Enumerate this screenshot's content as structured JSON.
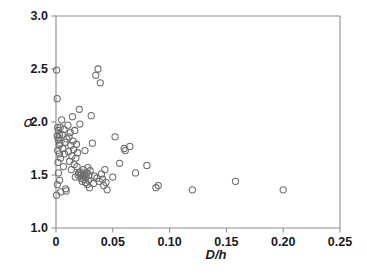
{
  "chart_data": {
    "type": "scatter",
    "title": "",
    "xlabel": "D/h",
    "ylabel": "σ",
    "xlim": [
      0,
      0.25
    ],
    "ylim": [
      1.0,
      3.0
    ],
    "xticks": [
      0,
      0.05,
      0.1,
      0.15,
      0.2,
      0.25
    ],
    "xtick_labels": [
      "0",
      "0.05",
      "0.10",
      "0.15",
      "0.20",
      "0.25"
    ],
    "yticks": [
      1.0,
      1.5,
      2.0,
      2.5,
      3.0
    ],
    "ytick_labels": [
      "1.0",
      "1.5",
      "2.0",
      "2.5",
      "3.0"
    ],
    "grid": false,
    "legend": null,
    "marker": "open-circle",
    "marker_size": 4.2,
    "marker_color": "#6b6b6b",
    "axis_color": "#8c8c8c",
    "background": "#ffffff",
    "n_points": 96,
    "series": [
      {
        "name": "samples",
        "x": [
          0.0005,
          0.0005,
          0.001,
          0.001,
          0.0012,
          0.0015,
          0.0015,
          0.0018,
          0.002,
          0.002,
          0.0022,
          0.0025,
          0.0028,
          0.003,
          0.003,
          0.0032,
          0.0035,
          0.0038,
          0.004,
          0.0042,
          0.005,
          0.0055,
          0.006,
          0.0065,
          0.007,
          0.0075,
          0.008,
          0.0085,
          0.009,
          0.0095,
          0.0105,
          0.011,
          0.0115,
          0.012,
          0.0125,
          0.013,
          0.0135,
          0.014,
          0.0145,
          0.015,
          0.0155,
          0.016,
          0.0165,
          0.017,
          0.0175,
          0.018,
          0.0185,
          0.019,
          0.0195,
          0.02,
          0.0205,
          0.021,
          0.0215,
          0.022,
          0.0225,
          0.023,
          0.0235,
          0.024,
          0.0245,
          0.025,
          0.0255,
          0.026,
          0.0265,
          0.027,
          0.0275,
          0.028,
          0.0285,
          0.029,
          0.0295,
          0.03,
          0.031,
          0.032,
          0.033,
          0.034,
          0.035,
          0.036,
          0.037,
          0.038,
          0.039,
          0.04,
          0.041,
          0.042,
          0.043,
          0.044,
          0.045,
          0.05,
          0.052,
          0.056,
          0.06,
          0.061,
          0.065,
          0.07,
          0.08,
          0.088,
          0.09,
          0.12,
          0.158,
          0.2
        ],
        "y": [
          2.49,
          1.31,
          2.22,
          1.87,
          1.41,
          1.95,
          1.73,
          1.62,
          1.92,
          1.83,
          1.52,
          1.85,
          1.78,
          1.88,
          1.7,
          1.45,
          1.8,
          1.95,
          1.66,
          1.34,
          2.02,
          1.88,
          1.75,
          1.58,
          1.93,
          1.7,
          1.81,
          1.37,
          1.35,
          1.84,
          1.97,
          1.72,
          1.86,
          1.63,
          1.9,
          1.78,
          1.55,
          1.68,
          2.05,
          1.82,
          1.74,
          1.6,
          1.92,
          1.48,
          1.66,
          1.79,
          1.58,
          1.71,
          1.5,
          1.52,
          2.12,
          1.98,
          1.53,
          1.47,
          1.51,
          1.44,
          1.49,
          1.55,
          1.46,
          1.5,
          1.73,
          1.43,
          1.48,
          1.52,
          1.41,
          1.57,
          1.45,
          1.5,
          1.38,
          1.54,
          2.06,
          1.8,
          1.42,
          1.49,
          2.44,
          1.47,
          2.5,
          1.44,
          2.37,
          1.51,
          1.46,
          1.4,
          1.55,
          1.43,
          1.36,
          1.48,
          1.86,
          1.61,
          1.75,
          1.73,
          1.77,
          1.52,
          1.59,
          1.38,
          1.4,
          1.36,
          1.44,
          1.36
        ]
      }
    ]
  }
}
